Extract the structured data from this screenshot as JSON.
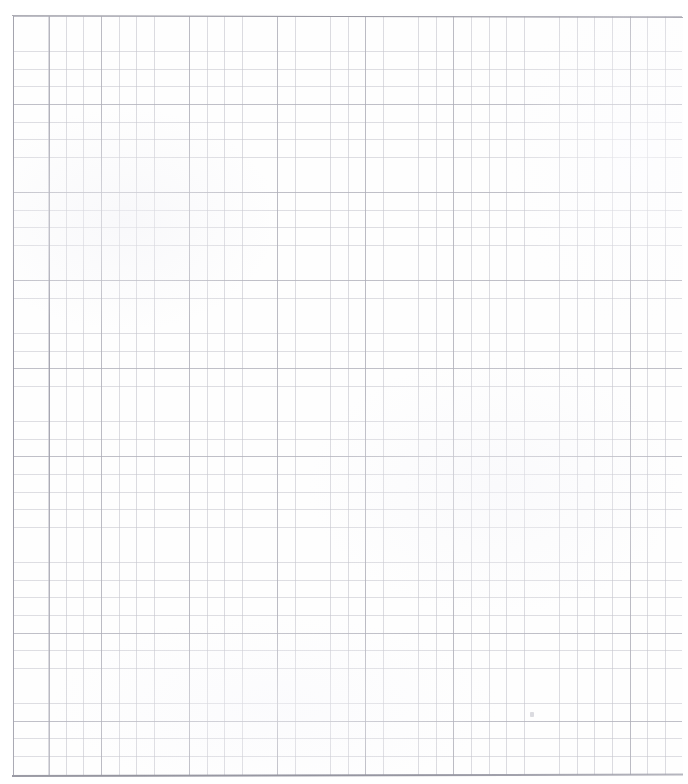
{
  "document": {
    "kind": "scanned-graph-paper",
    "title": "Blank graph paper sheet",
    "text_content": "",
    "annotations": [],
    "page_number": "",
    "caption": ""
  },
  "sheet": {
    "background_color": "#fefefe",
    "width_px": 688,
    "height_px": 784
  },
  "grid": {
    "minor_cell_px": 17.62,
    "major_cell_px": 88.1,
    "minor_line_color": "#c6c6ce",
    "major_line_color": "#acacb6",
    "origin_x_px": 13,
    "origin_y_px": 16,
    "grid_width_px": 669,
    "grid_height_px": 759,
    "columns": 38,
    "rows": 43
  },
  "rules": {
    "top_border_color": "#96969f",
    "bottom_border_color": "#8a8a96",
    "left_margin_color": "#9696ac",
    "second_margin_color": "#9e9eaa",
    "top_border_y_px": 15,
    "bottom_border_y_px": 775,
    "left_margin_x_px": 13,
    "second_margin_x_px": 48.5
  },
  "artifacts": {
    "speck_label": "pencil-speck",
    "speck_x_px": 530,
    "speck_y_px": 712
  }
}
